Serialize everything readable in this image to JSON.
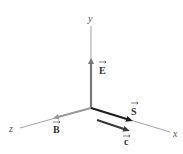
{
  "diagram": {
    "colors": {
      "axis": "#8a8a8a",
      "E": "#777777",
      "B": "#9a9a9a",
      "S": "#1e1e1e",
      "c": "#3a3a3a"
    },
    "axes": {
      "x": {
        "label": "x"
      },
      "y": {
        "label": "y"
      },
      "z": {
        "label": "z"
      }
    },
    "vectors": {
      "E": {
        "label": "E",
        "direction": "+y"
      },
      "B": {
        "label": "B",
        "direction": "+z"
      },
      "S": {
        "label": "S",
        "direction": "+x"
      },
      "c": {
        "label": "c",
        "direction": "+x"
      }
    }
  }
}
